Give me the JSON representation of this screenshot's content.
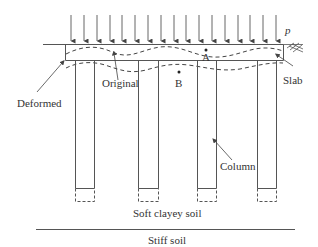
{
  "diagram": {
    "load_label": "p",
    "labels": {
      "original": "Original",
      "deformed": "Deformed",
      "point_a": "A",
      "point_b": "B",
      "slab": "Slab",
      "column": "Column",
      "soft_soil": "Soft clayey soil",
      "stiff_soil": "Stiff soil"
    },
    "colors": {
      "line": "#555555",
      "text": "#333333",
      "background": "#ffffff"
    }
  }
}
